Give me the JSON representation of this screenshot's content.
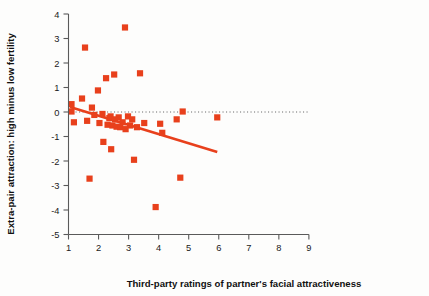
{
  "figure": {
    "background": "#fdfdfc",
    "marker_color": "#E8401C",
    "line_color": "#E8401C",
    "axis_color": "#5a5a5a",
    "zero_line_color": "#6a6a6a"
  },
  "chart_data": {
    "type": "scatter",
    "title": "",
    "xlabel": "Third-party ratings of partner's facial attractiveness",
    "ylabel": "Extra-pair attraction: high minus low fertility",
    "xlim": [
      1,
      9
    ],
    "ylim": [
      -5,
      4
    ],
    "xticks": [
      1,
      2,
      3,
      4,
      5,
      6,
      7,
      8,
      9
    ],
    "xtick_labels": [
      "1",
      "2",
      "3",
      "4",
      "5",
      "6",
      "7",
      "8",
      "9"
    ],
    "yticks": [
      -5,
      -4,
      -3,
      -2,
      -1,
      0,
      1,
      2,
      3,
      4
    ],
    "ytick_labels": [
      "-5",
      "-4",
      "-3",
      "-2",
      "-1",
      "0",
      "1",
      "2",
      "3",
      "4"
    ],
    "grid": false,
    "legend": null,
    "zero_reference_line": {
      "y": 0,
      "style": "dotted",
      "x_from": 1,
      "x_to": 9
    },
    "trend_line": {
      "style": "solid",
      "x_from": 1.05,
      "y_from": 0.2,
      "x_to": 5.95,
      "y_to": -1.63,
      "slope": -0.374,
      "intercept": 0.593
    },
    "points": [
      {
        "x": 1.1,
        "y": 0.32
      },
      {
        "x": 1.1,
        "y": 0.02
      },
      {
        "x": 1.18,
        "y": -0.42
      },
      {
        "x": 1.45,
        "y": 0.55
      },
      {
        "x": 1.55,
        "y": 2.63
      },
      {
        "x": 1.62,
        "y": -0.36
      },
      {
        "x": 1.7,
        "y": -2.72
      },
      {
        "x": 1.78,
        "y": 0.18
      },
      {
        "x": 1.86,
        "y": -0.12
      },
      {
        "x": 1.98,
        "y": 0.88
      },
      {
        "x": 2.03,
        "y": -0.45
      },
      {
        "x": 2.13,
        "y": -0.08
      },
      {
        "x": 2.16,
        "y": -1.22
      },
      {
        "x": 2.25,
        "y": 1.38
      },
      {
        "x": 2.3,
        "y": -0.52
      },
      {
        "x": 2.36,
        "y": -0.25
      },
      {
        "x": 2.4,
        "y": -0.18
      },
      {
        "x": 2.42,
        "y": -1.52
      },
      {
        "x": 2.46,
        "y": -0.55
      },
      {
        "x": 2.52,
        "y": 1.53
      },
      {
        "x": 2.55,
        "y": -0.3
      },
      {
        "x": 2.6,
        "y": -0.6
      },
      {
        "x": 2.67,
        "y": -0.22
      },
      {
        "x": 2.72,
        "y": -0.62
      },
      {
        "x": 2.8,
        "y": -0.42
      },
      {
        "x": 2.88,
        "y": 3.45
      },
      {
        "x": 2.9,
        "y": -0.7
      },
      {
        "x": 2.98,
        "y": -0.18
      },
      {
        "x": 3.05,
        "y": -0.55
      },
      {
        "x": 3.12,
        "y": -0.3
      },
      {
        "x": 3.18,
        "y": -1.95
      },
      {
        "x": 3.28,
        "y": -0.62
      },
      {
        "x": 3.38,
        "y": 1.58
      },
      {
        "x": 3.52,
        "y": -0.45
      },
      {
        "x": 3.9,
        "y": -3.88
      },
      {
        "x": 4.05,
        "y": -0.48
      },
      {
        "x": 4.12,
        "y": -0.85
      },
      {
        "x": 4.6,
        "y": -0.3
      },
      {
        "x": 4.72,
        "y": -2.68
      },
      {
        "x": 4.8,
        "y": 0.02
      },
      {
        "x": 5.95,
        "y": -0.22
      }
    ]
  }
}
